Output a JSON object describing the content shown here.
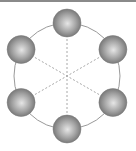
{
  "diagram": {
    "sphere_count": 6,
    "angles_deg": [
      -90,
      -30,
      30,
      90,
      150,
      210
    ],
    "connections": [
      [
        0,
        3
      ],
      [
        1,
        4
      ],
      [
        2,
        5
      ]
    ],
    "colors": {
      "ring": "#9a9a9a",
      "dash": "#a8a8a8",
      "sphere_light": "#e6e6e6",
      "sphere_mid": "#a6a6a6",
      "sphere_dark": "#6e6e6e",
      "topbar": "#8a8a8a"
    }
  }
}
